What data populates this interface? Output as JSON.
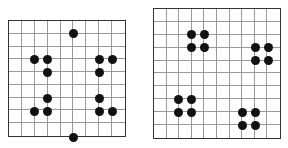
{
  "grids": [
    {
      "name": "left-grid",
      "rows": 9,
      "cols": 9,
      "x": 8,
      "y": 20,
      "width": 118,
      "height": 117,
      "dots": [
        [
          0,
          4
        ],
        [
          2,
          1
        ],
        [
          2,
          2
        ],
        [
          2,
          6
        ],
        [
          2,
          7
        ],
        [
          3,
          2
        ],
        [
          3,
          6
        ],
        [
          5,
          2
        ],
        [
          5,
          6
        ],
        [
          6,
          1
        ],
        [
          6,
          2
        ],
        [
          6,
          6
        ],
        [
          6,
          7
        ],
        [
          8,
          4
        ]
      ]
    },
    {
      "name": "right-grid",
      "rows": 10,
      "cols": 10,
      "x": 153,
      "y": 8,
      "width": 128,
      "height": 131,
      "dots": [
        [
          1,
          2
        ],
        [
          1,
          3
        ],
        [
          2,
          2
        ],
        [
          2,
          3
        ],
        [
          2,
          7
        ],
        [
          2,
          8
        ],
        [
          3,
          7
        ],
        [
          3,
          8
        ],
        [
          6,
          1
        ],
        [
          6,
          2
        ],
        [
          7,
          1
        ],
        [
          7,
          2
        ],
        [
          7,
          6
        ],
        [
          7,
          7
        ],
        [
          8,
          6
        ],
        [
          8,
          7
        ]
      ]
    }
  ],
  "colors": {
    "dot": "#111111",
    "line": "#999999",
    "border": "#333333"
  }
}
